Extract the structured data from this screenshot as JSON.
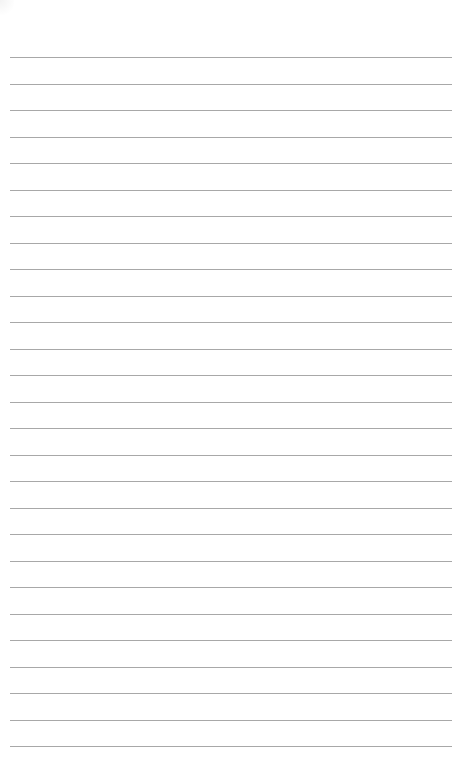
{
  "page": {
    "type": "lined-paper",
    "background_color": "#ffffff",
    "rule_color": "#a8a8a8",
    "rules": {
      "count": 27,
      "first_y": 57,
      "spacing": 26.5,
      "left_x": 10,
      "right_x": 452
    }
  }
}
